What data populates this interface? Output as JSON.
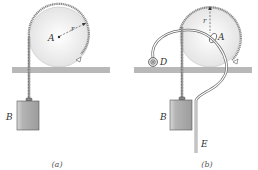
{
  "figure": {
    "panel_a": {
      "caption": "(a)",
      "labels": {
        "center": "A",
        "radius": "r",
        "block": "B"
      }
    },
    "panel_b": {
      "caption": "(b)",
      "labels": {
        "center": "A",
        "radius": "r",
        "block": "B",
        "reel": "D",
        "hose_end": "E"
      }
    }
  },
  "colors": {
    "ground": "#b8b8b8",
    "disk_fill": "#ececec",
    "rope": "#888888",
    "block_fill": "#a8a8a8",
    "block_highlight": "#d8d8d8",
    "outline": "#555555"
  }
}
